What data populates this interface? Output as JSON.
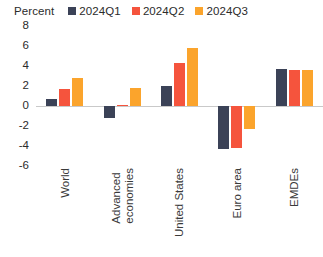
{
  "chart_data": {
    "type": "bar",
    "title": "",
    "subtitle": "",
    "xlabel": "",
    "ylabel": "Percent",
    "ylim": [
      -6,
      8
    ],
    "yticks": [
      8,
      6,
      4,
      2,
      0,
      -2,
      -4,
      -6
    ],
    "ytick_labels": [
      "8",
      "6",
      "4",
      "2",
      "0",
      "-2",
      "-4",
      "-6"
    ],
    "grid": false,
    "zero_line": true,
    "legend_position": "top",
    "categories": [
      "World",
      "Advanced economies",
      "United States",
      "Euro area",
      "EMDEs"
    ],
    "category_lines": [
      [
        "World"
      ],
      [
        "Advanced",
        "economies"
      ],
      [
        "United States"
      ],
      [
        "Euro area"
      ],
      [
        "EMDEs"
      ]
    ],
    "series": [
      {
        "name": "2024Q1",
        "color": "#3b4257",
        "values": [
          0.7,
          -1.2,
          2.0,
          -4.3,
          3.7
        ]
      },
      {
        "name": "2024Q2",
        "color": "#f5543d",
        "values": [
          1.7,
          0.1,
          4.3,
          -4.2,
          3.6
        ]
      },
      {
        "name": "2024Q3",
        "color": "#fba42c",
        "values": [
          2.8,
          1.8,
          5.8,
          -2.3,
          3.6
        ]
      }
    ]
  },
  "legend": {
    "unit_label": "Percent",
    "entries": [
      {
        "label": "2024Q1",
        "color": "#3b4257"
      },
      {
        "label": "2024Q2",
        "color": "#f5543d"
      },
      {
        "label": "2024Q3",
        "color": "#fba42c"
      }
    ]
  },
  "colors": {
    "q1": "#3b4257",
    "q2": "#f5543d",
    "q3": "#fba42c",
    "axis": "#c9c9c9",
    "text": "#2b2b2b",
    "background": "#ffffff"
  }
}
